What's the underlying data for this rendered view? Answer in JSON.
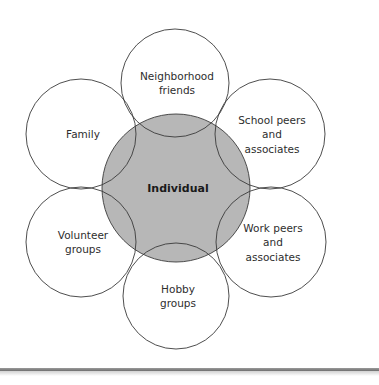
{
  "diagram": {
    "type": "network-of-circles",
    "center": {
      "label": "Individual",
      "cx": 176,
      "cy": 188,
      "r": 74,
      "fill": "#b7b7b7"
    },
    "outer": [
      {
        "id": "neighborhood",
        "lines": [
          "Neighborhood",
          "friends"
        ],
        "cx": 175,
        "cy": 83,
        "r": 54
      },
      {
        "id": "school",
        "lines": [
          "School peers",
          "and",
          "associates"
        ],
        "cx": 270,
        "cy": 134,
        "r": 55
      },
      {
        "id": "work",
        "lines": [
          "Work peers",
          "and",
          "associates"
        ],
        "cx": 271,
        "cy": 242,
        "r": 55
      },
      {
        "id": "hobby",
        "lines": [
          "Hobby",
          "groups"
        ],
        "cx": 176,
        "cy": 296,
        "r": 53
      },
      {
        "id": "volunteer",
        "lines": [
          "Volunteer",
          "groups"
        ],
        "cx": 81,
        "cy": 242,
        "r": 55
      },
      {
        "id": "family",
        "lines": [
          "Family"
        ],
        "cx": 81,
        "cy": 134,
        "r": 55
      }
    ],
    "stroke": "#3a3a3a"
  }
}
